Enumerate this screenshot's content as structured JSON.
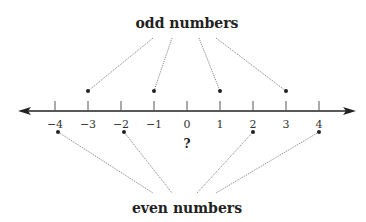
{
  "diagram": {
    "top_label": "odd numbers",
    "bottom_label": "even numbers",
    "question_mark": "?",
    "axis": {
      "min": -4,
      "max": 4,
      "tick_labels": [
        "−4",
        "−3",
        "−2",
        "−1",
        "0",
        "1",
        "2",
        "3",
        "4"
      ],
      "arrows": "both"
    },
    "odd_pointers": [
      -3,
      -1,
      1,
      3
    ],
    "even_pointers": [
      -4,
      -2,
      2,
      4
    ],
    "unlabeled_value": 0,
    "colors": {
      "axis": "#222222",
      "pointer_line": "#888888",
      "dot": "#222222"
    }
  }
}
